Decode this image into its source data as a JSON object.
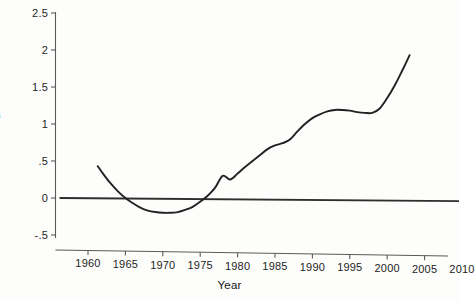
{
  "chart_data": {
    "type": "line",
    "title": "",
    "xlabel": "Year",
    "ylabel": "Growth Rate of Agricultural TFP",
    "xlim": [
      1955,
      2011
    ],
    "ylim": [
      -0.5,
      2.5
    ],
    "xticks": [
      1960,
      1965,
      1970,
      1975,
      1980,
      1985,
      1990,
      1995,
      2000,
      2005,
      2010
    ],
    "xtick_labels": [
      "1960",
      "1965",
      "1970",
      "1975",
      "1980",
      "1985",
      "1990",
      "1995",
      "2000",
      "2005",
      "2010"
    ],
    "yticks": [
      -0.5,
      0,
      0.5,
      1,
      1.5,
      2,
      2.5
    ],
    "ytick_labels": [
      "-.5",
      "0",
      ".5",
      "1",
      "1.5",
      "2",
      "2.5"
    ],
    "grid": false,
    "legend": false,
    "line_color": "#222222",
    "zero_line_color": "#333333",
    "axis_color": "#555555",
    "series": [
      {
        "name": "Growth Rate of Agricultural TFP",
        "x": [
          1961.3,
          1962,
          1963,
          1964,
          1965,
          1966,
          1967,
          1968,
          1969,
          1970,
          1971,
          1972,
          1973,
          1974,
          1975,
          1976,
          1977,
          1978,
          1979,
          1980,
          1981,
          1982,
          1983,
          1984,
          1985,
          1986,
          1987,
          1988,
          1989,
          1990,
          1991,
          1992,
          1993,
          1994,
          1995,
          1996,
          1997,
          1998,
          1999,
          2000,
          2001,
          2002,
          2003
        ],
        "values": [
          0.43,
          0.33,
          0.2,
          0.09,
          0.0,
          -0.07,
          -0.13,
          -0.17,
          -0.19,
          -0.2,
          -0.2,
          -0.19,
          -0.16,
          -0.12,
          -0.05,
          0.03,
          0.14,
          0.3,
          0.25,
          0.33,
          0.42,
          0.5,
          0.58,
          0.66,
          0.71,
          0.74,
          0.79,
          0.9,
          1.0,
          1.08,
          1.13,
          1.17,
          1.19,
          1.19,
          1.18,
          1.16,
          1.15,
          1.15,
          1.21,
          1.35,
          1.52,
          1.72,
          1.93
        ]
      }
    ],
    "zero_line": {
      "name": "zero-reference",
      "x_start": 1956.2,
      "x_end": 2011.5,
      "value": 0
    },
    "annotations": {
      "start_value": 0.43,
      "minimum_value": -0.2,
      "minimum_year": 1971,
      "end_value": 1.93,
      "end_year": 2003
    }
  }
}
